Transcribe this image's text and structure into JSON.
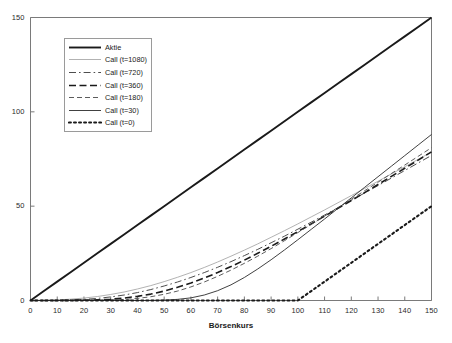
{
  "chart_data": {
    "type": "line",
    "title": "",
    "subtitle": "",
    "xlabel": "Börsenkurs",
    "ylabel": "",
    "xlim": [
      0,
      150
    ],
    "ylim": [
      0,
      150
    ],
    "xticks": [
      0,
      10,
      20,
      30,
      40,
      50,
      60,
      70,
      80,
      90,
      100,
      110,
      120,
      130,
      140,
      150
    ],
    "yticks": [
      0,
      50,
      100,
      150
    ],
    "grid": false,
    "legend_position": "upper-left-inside",
    "strike": 100,
    "x": [
      0,
      5,
      10,
      15,
      20,
      25,
      30,
      35,
      40,
      45,
      50,
      55,
      60,
      65,
      70,
      75,
      80,
      85,
      90,
      95,
      100,
      105,
      110,
      115,
      120,
      125,
      130,
      135,
      140,
      145,
      150
    ],
    "series": [
      {
        "name": "Aktie",
        "style": "solid",
        "width": 1.9,
        "color": "#1a1a1a",
        "values": [
          0,
          5,
          10,
          15,
          20,
          25,
          30,
          35,
          40,
          45,
          50,
          55,
          60,
          65,
          70,
          75,
          80,
          85,
          90,
          95,
          100,
          105,
          110,
          115,
          120,
          125,
          130,
          135,
          140,
          145,
          150
        ]
      },
      {
        "name": "Call (t=1080)",
        "style": "solid",
        "width": 0.8,
        "color": "#9e9e9e",
        "values": [
          0,
          0.1,
          0.3,
          0.7,
          1.3,
          2.1,
          3.2,
          4.5,
          6.1,
          7.9,
          10.0,
          12.3,
          14.8,
          17.5,
          20.4,
          23.5,
          26.7,
          30.0,
          33.5,
          37.0,
          40.6,
          44.3,
          48.0,
          51.8,
          55.6,
          59.4,
          63.2,
          67.1,
          70.9,
          74.8,
          78.7
        ]
      },
      {
        "name": "Call (t=720)",
        "style": "dashdot",
        "width": 0.9,
        "color": "#3a3a3a",
        "values": [
          0,
          0.02,
          0.1,
          0.3,
          0.6,
          1.1,
          1.9,
          2.9,
          4.2,
          5.8,
          7.7,
          9.8,
          12.2,
          14.8,
          17.6,
          20.6,
          23.8,
          27.1,
          30.6,
          34.1,
          37.8,
          41.5,
          45.3,
          49.2,
          53.1,
          57.0,
          60.9,
          64.9,
          68.9,
          72.9,
          76.9
        ]
      },
      {
        "name": "Call (t=360)",
        "style": "dash-long",
        "width": 1.6,
        "color": "#1a1a1a",
        "values": [
          0,
          0,
          0.01,
          0.05,
          0.15,
          0.35,
          0.7,
          1.3,
          2.2,
          3.4,
          5.0,
          7.0,
          9.3,
          11.9,
          14.8,
          18.0,
          21.4,
          25.0,
          28.7,
          32.6,
          36.5,
          40.6,
          44.7,
          48.8,
          53.0,
          57.2,
          61.5,
          65.8,
          70.1,
          74.4,
          78.8
        ]
      },
      {
        "name": "Call (t=180)",
        "style": "dashed",
        "width": 0.9,
        "color": "#4a4a4a",
        "values": [
          0,
          0,
          0,
          0.01,
          0.03,
          0.1,
          0.25,
          0.55,
          1.1,
          2.0,
          3.3,
          5.0,
          7.2,
          9.8,
          12.8,
          16.1,
          19.7,
          23.5,
          27.5,
          31.7,
          36.0,
          40.3,
          44.7,
          49.2,
          53.7,
          58.2,
          62.7,
          67.3,
          71.8,
          76.4,
          81.0
        ]
      },
      {
        "name": "Call (t=30)",
        "style": "solid",
        "width": 0.9,
        "color": "#2b2b2b",
        "values": [
          0,
          0,
          0,
          0,
          0,
          0,
          0,
          0,
          0.01,
          0.05,
          0.2,
          0.6,
          1.4,
          2.9,
          5.2,
          8.3,
          12.2,
          16.7,
          21.6,
          26.8,
          32.2,
          37.7,
          43.2,
          48.8,
          54.4,
          60.0,
          65.6,
          71.2,
          76.8,
          82.4,
          88.0
        ]
      },
      {
        "name": "Call (t=0)",
        "style": "dotted",
        "width": 2.1,
        "color": "#1a1a1a",
        "values": [
          0,
          0,
          0,
          0,
          0,
          0,
          0,
          0,
          0,
          0,
          0,
          0,
          0,
          0,
          0,
          0,
          0,
          0,
          0,
          0,
          0,
          5,
          10,
          15,
          20,
          25,
          30,
          35,
          40,
          45,
          50
        ]
      }
    ]
  },
  "legend": {
    "items": [
      {
        "label": "Aktie"
      },
      {
        "label": "Call (t=1080)"
      },
      {
        "label": "Call (t=720)"
      },
      {
        "label": "Call (t=360)"
      },
      {
        "label": "Call (t=180)"
      },
      {
        "label": "Call (t=30)"
      },
      {
        "label": "Call (t=0)"
      }
    ]
  },
  "colors": {
    "axis": "#7a7a7a",
    "text": "#1a1a1a",
    "background": "#ffffff",
    "legend_border": "#9a9a9a"
  }
}
